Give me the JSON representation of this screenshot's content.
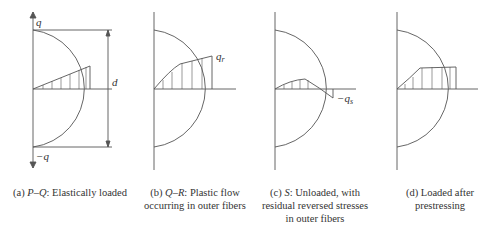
{
  "panels": [
    {
      "id": "a",
      "labels": {
        "top": "q",
        "bottom": "−q",
        "depth": "d"
      },
      "caption_prefix": "(a) ",
      "caption_italic": "P–Q",
      "caption_rest": ": Elastically loaded",
      "caption_line2": ""
    },
    {
      "id": "b",
      "labels": {
        "stress": "q",
        "stress_sub": "r"
      },
      "caption_prefix": "(b) ",
      "caption_italic": "Q–R",
      "caption_rest": ": Plastic flow",
      "caption_line2": "occurring in outer fibers"
    },
    {
      "id": "c",
      "labels": {
        "stress": "−q",
        "stress_sub": "s"
      },
      "caption_prefix": "(c) ",
      "caption_italic": "S",
      "caption_rest": ": Unloaded, with",
      "caption_line2": "residual reversed stresses",
      "caption_line3": "in outer fibers"
    },
    {
      "id": "d",
      "labels": {},
      "caption_prefix": "(d) Loaded after",
      "caption_italic": "",
      "caption_rest": "",
      "caption_line2": "prestressing"
    }
  ]
}
